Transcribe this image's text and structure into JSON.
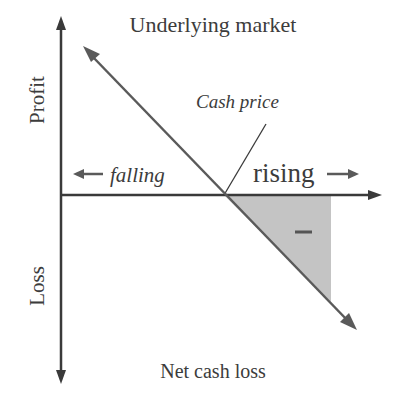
{
  "diagram": {
    "title": "Underlying market",
    "y_axis": {
      "positive_label": "Profit",
      "negative_label": "Loss"
    },
    "x_axis": {
      "left_label": "falling",
      "right_label": "rising"
    },
    "annotations": {
      "cash_price": "Cash price",
      "shaded_region_sign": "–",
      "caption": "Net cash loss"
    },
    "colors": {
      "axis": "#3a3a3a",
      "line": "#5a5a5a",
      "shade": "#c4c4c4",
      "text": "#3c3c3c"
    },
    "geometry": {
      "origin": [
        61,
        195
      ],
      "breakeven_point": [
        224,
        195
      ],
      "loss_line": {
        "from": [
          84,
          47
        ],
        "to": [
          356,
          329
        ]
      },
      "cash_price_line": {
        "from": [
          224,
          195
        ],
        "to": [
          266,
          124
        ]
      },
      "shaded_triangle": [
        [
          224,
          195
        ],
        [
          331,
          195
        ],
        [
          331,
          302
        ]
      ]
    }
  }
}
